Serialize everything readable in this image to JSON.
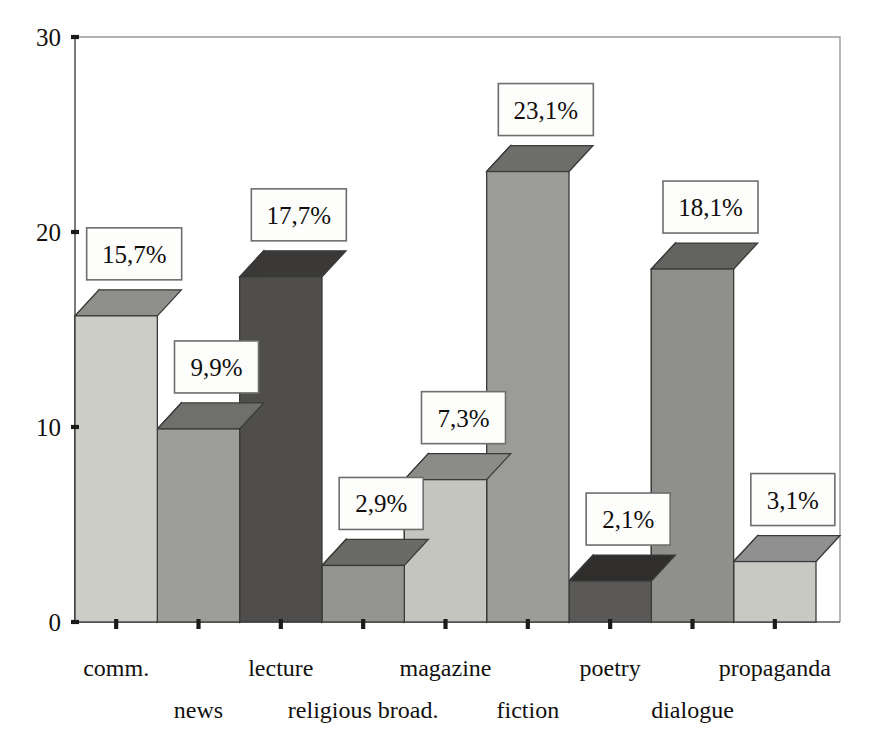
{
  "chart_data": {
    "type": "bar",
    "title": "",
    "subtitle": "",
    "xlabel": "",
    "ylabel": "",
    "categories": [
      "comm.",
      "news",
      "lecture",
      "religious broad.",
      "magazine",
      "fiction",
      "poetry",
      "dialogue",
      "propaganda"
    ],
    "values": [
      15.7,
      9.9,
      17.7,
      2.9,
      7.3,
      23.1,
      2.1,
      18.1,
      3.1
    ],
    "value_labels": [
      "15,7%",
      "9,9%",
      "17,7%",
      "2,9%",
      "7,3%",
      "23,1%",
      "2,1%",
      "18,1%",
      "3,1%"
    ],
    "ylim": [
      0,
      30
    ],
    "y_ticks": [
      0,
      10,
      20,
      30
    ],
    "y_tick_labels": [
      "0",
      "10",
      "20",
      "30"
    ],
    "grid": false,
    "legend": "none",
    "style": "3d-bars",
    "decimal_separator": ",",
    "bar_colors": [
      {
        "face": "#cdcdc8",
        "top": "#8e8e8a",
        "side": "#b0b0ab"
      },
      {
        "face": "#9d9d99",
        "top": "#6f6f6c",
        "side": "#8a8a86"
      },
      {
        "face": "#4f4e4c",
        "top": "#3a3937",
        "side": "#454442"
      },
      {
        "face": "#949490",
        "top": "#6a6a67",
        "side": "#828280"
      },
      {
        "face": "#c5c5c0",
        "top": "#8b8b87",
        "side": "#aaaaa6"
      },
      {
        "face": "#9b9b97",
        "top": "#6d6d6a",
        "side": "#878784"
      },
      {
        "face": "#5a5957",
        "top": "#2f2e2c",
        "side": "#4a4947"
      },
      {
        "face": "#8f8f8b",
        "top": "#636360",
        "side": "#7c7c79"
      },
      {
        "face": "#c9c9c4",
        "top": "#909090",
        "side": "#aeaeaa"
      }
    ]
  },
  "axes": {
    "y_axis_name": "value-axis",
    "x_axis_name": "category-axis"
  }
}
